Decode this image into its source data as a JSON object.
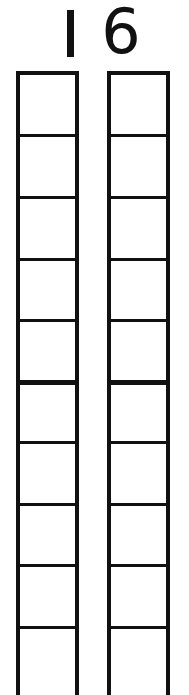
{
  "number": {
    "value": "16",
    "tens_digit": "1",
    "ones_digit": "6"
  },
  "columns": [
    {
      "name": "tens-column",
      "divider_offsets": [
        59,
        121,
        183,
        244,
        305,
        366,
        428,
        489,
        551
      ],
      "thick_divider_index": 4
    },
    {
      "name": "ones-column",
      "divider_offsets": [
        59,
        121,
        183,
        244,
        305,
        366,
        428,
        489,
        551
      ],
      "thick_divider_index": 4
    }
  ],
  "colors": {
    "line": "#111111",
    "background": "#ffffff"
  }
}
